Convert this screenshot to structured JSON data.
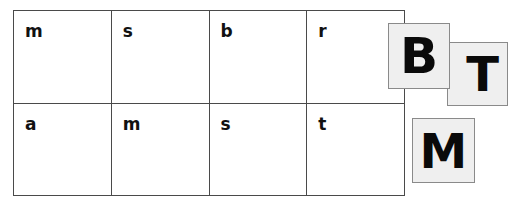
{
  "canvas": {
    "width": 517,
    "height": 203,
    "background_color": "#ffffff"
  },
  "grid": {
    "name": "letter-grid",
    "columns": 4,
    "rows": 2,
    "border_color": "#4a4a4a",
    "cell_background": "#ffffff",
    "text_color": "#111111",
    "cells": [
      [
        "m",
        "s",
        "b",
        "r"
      ],
      [
        "a",
        "m",
        "s",
        "t"
      ]
    ]
  },
  "tiles": {
    "fill_color": "#efefef",
    "border_color": "#8a8a8a",
    "text_color": "#0a0a0a",
    "items": [
      {
        "id": "tile-b",
        "letter": "B"
      },
      {
        "id": "tile-t",
        "letter": "T"
      },
      {
        "id": "tile-m",
        "letter": "M"
      }
    ]
  }
}
